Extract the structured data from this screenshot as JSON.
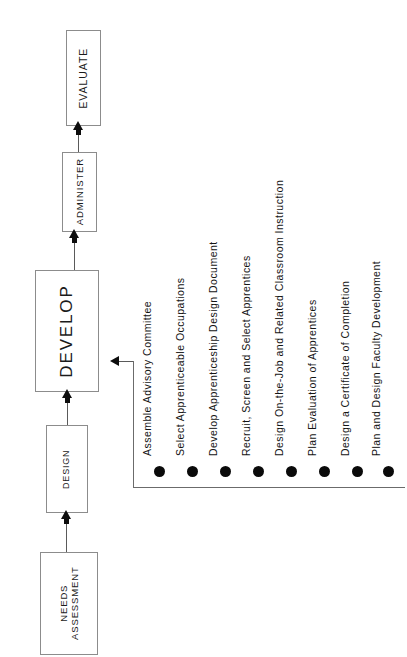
{
  "diagram": {
    "background_color": "#ffffff",
    "line_color": "#5a5a5a",
    "bullet_color": "#0a0a0a",
    "box_border_color": "#8c8c8c"
  },
  "flow": {
    "orientation": "bottom-to-top",
    "stages": [
      {
        "id": "needs-assessment",
        "label": "NEEDS\nASSESSMENT",
        "line1": "NEEDS",
        "line2": "ASSESSMENT"
      },
      {
        "id": "design",
        "label": "DESIGN"
      },
      {
        "id": "develop",
        "label": "DEVELOP"
      },
      {
        "id": "administer",
        "label": "ADMINISTER"
      },
      {
        "id": "evaluate",
        "label": "EVALUATE"
      }
    ]
  },
  "tasks": {
    "attached_to": "DEVELOP",
    "items": [
      {
        "index": 1,
        "label": "Assemble Advisory Committee"
      },
      {
        "index": 2,
        "label": "Select Apprenticeable Occupations"
      },
      {
        "index": 3,
        "label": "Develop Apprenticeship Design Document"
      },
      {
        "index": 4,
        "label": "Recruit, Screen and Select Apprentices"
      },
      {
        "index": 5,
        "label": "Design On-the-Job and Related Classroom Instruction"
      },
      {
        "index": 6,
        "label": "Plan Evaluation of Apprentices"
      },
      {
        "index": 7,
        "label": "Design a Certificate of Completion"
      },
      {
        "index": 8,
        "label": "Plan and Design Faculty Development"
      }
    ]
  }
}
